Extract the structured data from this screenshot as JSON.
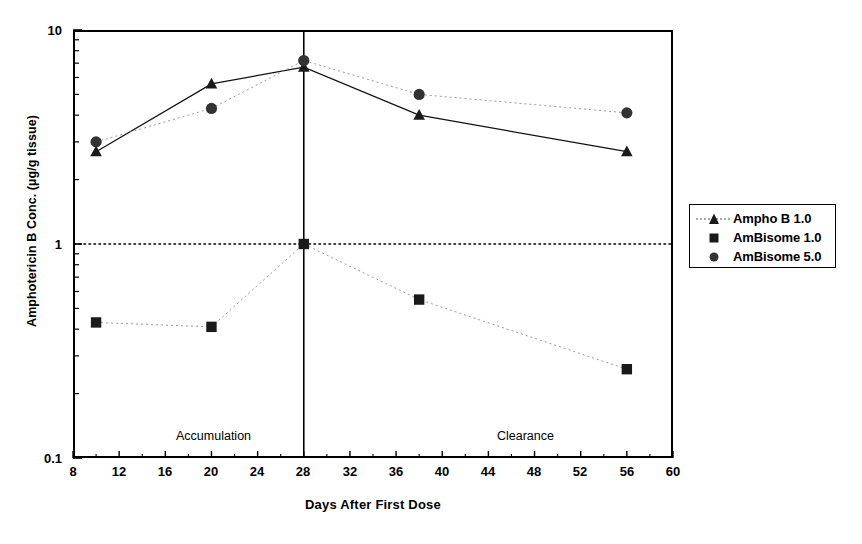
{
  "chart_data": {
    "type": "line",
    "title": "",
    "xlabel": "Days After First Dose",
    "ylabel": "Amphotericin B Conc. (µg/g tissue)",
    "yscale": "log",
    "ylim": [
      0.1,
      10
    ],
    "xlim": [
      8,
      60
    ],
    "xticks": [
      8,
      12,
      16,
      20,
      24,
      28,
      32,
      36,
      40,
      44,
      48,
      52,
      56,
      60
    ],
    "xtick_labels": [
      "8",
      "12",
      "16",
      "20",
      "24",
      "28",
      "32",
      "36",
      "40",
      "44",
      "48",
      "52",
      "56",
      "60"
    ],
    "yticks": [
      0.1,
      1,
      10
    ],
    "ytick_labels": [
      "0.1",
      "1",
      "10"
    ],
    "grid": false,
    "reference_lines": [
      {
        "name": "unity-horizontal-line",
        "orientation": "horizontal",
        "value": 1,
        "style": "dotted"
      },
      {
        "name": "dose-end-vertical-line",
        "orientation": "vertical",
        "value": 28,
        "style": "solid"
      }
    ],
    "annotations": [
      {
        "name": "accumulation-label",
        "text": "Accumulation",
        "x": 13.8,
        "y": 0.128
      },
      {
        "name": "clearance-label",
        "text": "Clearance",
        "x": 41.6,
        "y": 0.128
      }
    ],
    "legend_position": "right-outside",
    "series": [
      {
        "name": "Ampho B 1.0",
        "marker": "triangle",
        "color": "#1a1a1a",
        "x": [
          10,
          20,
          28,
          38,
          56
        ],
        "values": [
          2.7,
          5.6,
          6.7,
          4.0,
          2.7
        ]
      },
      {
        "name": "AmBisome 1.0",
        "marker": "square",
        "color": "#1a1a1a",
        "x": [
          10,
          20,
          28,
          38,
          56
        ],
        "values": [
          0.43,
          0.41,
          1.0,
          0.55,
          0.26
        ]
      },
      {
        "name": "AmBisome 5.0",
        "marker": "circle",
        "color": "#333333",
        "x": [
          10,
          20,
          28,
          38,
          56
        ],
        "values": [
          3.0,
          4.3,
          7.2,
          5.0,
          4.1
        ]
      }
    ]
  },
  "axes": {
    "x_title": "Days After First Dose",
    "y_title": "Amphotericin B Conc. (µg/g tissue)",
    "x_tick_labels": [
      "8",
      "12",
      "16",
      "20",
      "24",
      "28",
      "32",
      "36",
      "40",
      "44",
      "48",
      "52",
      "56",
      "60"
    ],
    "y_tick_labels": [
      "10",
      "1",
      "0.1"
    ]
  },
  "annotations": {
    "accumulation": "Accumulation",
    "clearance": "Clearance"
  },
  "legend": {
    "items": [
      {
        "label": "Ampho B 1.0",
        "marker": "triangle-marker-icon"
      },
      {
        "label": "AmBisome 1.0",
        "marker": "square-marker-icon"
      },
      {
        "label": "AmBisome 5.0",
        "marker": "circle-marker-icon"
      }
    ]
  },
  "colors": {
    "ink": "#000000",
    "marker": "#1a1a1a",
    "circle_marker": "#333333"
  }
}
